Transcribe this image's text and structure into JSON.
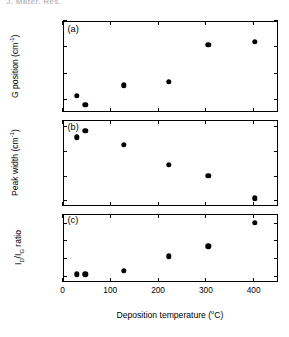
{
  "page_header": "J. Mater. Res.",
  "figure": {
    "xaxis": {
      "title": "Deposition temperature (°C)",
      "title_main": "Deposition temperature (",
      "title_unit": "o",
      "title_tail": "C)",
      "ticks": [
        0,
        100,
        200,
        300,
        400
      ],
      "tick_labels": [
        "0",
        "100",
        "200",
        "300",
        "400"
      ],
      "min": 0,
      "max": 450
    },
    "panels": [
      {
        "tag": "(a)",
        "ylabel_main": "G position (cm",
        "ylabel_sup": "-1",
        "ylabel_tail": ")",
        "ylabel": "G position (cm-1)",
        "tick_labels": [
          "1555",
          "1570",
          "1585",
          "1600"
        ]
      },
      {
        "tag": "(b)",
        "ylabel_main": "Peak width (cm",
        "ylabel_sup": "-1",
        "ylabel_tail": ")",
        "ylabel": "Peak width (cm-1)",
        "tick_labels": [
          "150",
          "200",
          "250",
          "300"
        ]
      },
      {
        "tag": "(c)",
        "ylabel_main": "I",
        "ylabel_sub1": "D",
        "ylabel_mid": "/I",
        "ylabel_sub2": "G",
        "ylabel_tail": " ratio",
        "ylabel": "ID/IG ratio",
        "tick_labels": [
          "0",
          "0.4",
          "0.8",
          "1.2"
        ]
      }
    ]
  },
  "chart_data": [
    {
      "type": "scatter",
      "title": "(a)",
      "xlabel": "Deposition temperature (°C)",
      "ylabel": "G position (cm^-1)",
      "xlim": [
        0,
        450
      ],
      "ylim": [
        1548,
        1600
      ],
      "xticks": [
        0,
        100,
        200,
        300,
        400
      ],
      "yticks": [
        1555,
        1570,
        1585,
        1600
      ],
      "grid": false,
      "legend": "none",
      "marker": "filled-circle",
      "color": "#000000",
      "x": [
        30,
        48,
        128,
        222,
        305,
        402
      ],
      "y": [
        1557,
        1552,
        1563,
        1565,
        1586,
        1588
      ]
    },
    {
      "type": "scatter",
      "title": "(b)",
      "xlabel": "Deposition temperature (°C)",
      "ylabel": "Peak width (cm^-1)",
      "xlim": [
        0,
        450
      ],
      "ylim": [
        140,
        315
      ],
      "xticks": [
        0,
        100,
        200,
        300,
        400
      ],
      "yticks": [
        150,
        200,
        250,
        300
      ],
      "grid": false,
      "legend": "none",
      "marker": "filled-circle",
      "color": "#000000",
      "x": [
        30,
        48,
        128,
        222,
        305,
        402
      ],
      "y": [
        279,
        292,
        264,
        223,
        200,
        155
      ]
    },
    {
      "type": "scatter",
      "title": "(c)",
      "xlabel": "Deposition temperature (°C)",
      "ylabel": "I_D/I_G ratio",
      "xlim": [
        0,
        450
      ],
      "ylim": [
        -0.12,
        1.42
      ],
      "xticks": [
        0,
        100,
        200,
        300,
        400
      ],
      "yticks": [
        0,
        0.4,
        0.8,
        1.2
      ],
      "grid": false,
      "legend": "none",
      "marker": "filled-circle",
      "color": "#000000",
      "x": [
        30,
        48,
        128,
        222,
        305,
        402
      ],
      "y": [
        0.04,
        0.04,
        0.12,
        0.45,
        0.68,
        1.21
      ]
    }
  ]
}
